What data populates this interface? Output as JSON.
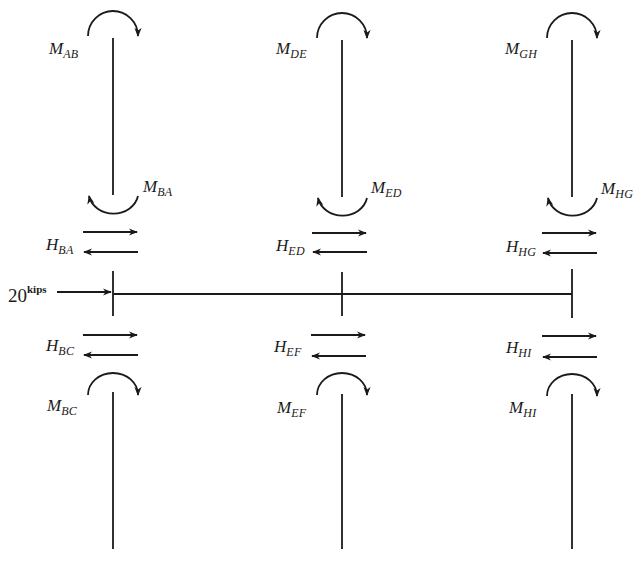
{
  "figure": {
    "load": {
      "value": "20",
      "unit": "kips",
      "direction": "right",
      "applied_at": "left joint of beam"
    },
    "columns": [
      {
        "name": "left",
        "x": 113,
        "upper_member": {
          "top_moment": {
            "symbol": "M",
            "subscript": "AB",
            "direction": "clockwise"
          },
          "bottom_moment": {
            "symbol": "M",
            "subscript": "BA",
            "direction": "counterclockwise"
          },
          "shear": {
            "symbol": "H",
            "subscript": "BA"
          }
        },
        "lower_member": {
          "shear": {
            "symbol": "H",
            "subscript": "BC"
          },
          "top_moment": {
            "symbol": "M",
            "subscript": "BC",
            "direction": "clockwise"
          }
        }
      },
      {
        "name": "middle",
        "x": 342,
        "upper_member": {
          "top_moment": {
            "symbol": "M",
            "subscript": "DE",
            "direction": "clockwise"
          },
          "bottom_moment": {
            "symbol": "M",
            "subscript": "ED",
            "direction": "counterclockwise"
          },
          "shear": {
            "symbol": "H",
            "subscript": "ED"
          }
        },
        "lower_member": {
          "shear": {
            "symbol": "H",
            "subscript": "EF"
          },
          "top_moment": {
            "symbol": "M",
            "subscript": "EF",
            "direction": "clockwise"
          }
        }
      },
      {
        "name": "right",
        "x": 572,
        "upper_member": {
          "top_moment": {
            "symbol": "M",
            "subscript": "GH",
            "direction": "clockwise"
          },
          "bottom_moment": {
            "symbol": "M",
            "subscript": "HG",
            "direction": "counterclockwise"
          },
          "shear": {
            "symbol": "H",
            "subscript": "HG"
          }
        },
        "lower_member": {
          "shear": {
            "symbol": "H",
            "subscript": "HI"
          },
          "top_moment": {
            "symbol": "M",
            "subscript": "HI",
            "direction": "clockwise"
          }
        }
      }
    ],
    "beam": {
      "y": 294,
      "from_x": 113,
      "to_x": 572
    },
    "colors": {
      "ink": "#1a1a1a",
      "background": "#ffffff"
    }
  }
}
